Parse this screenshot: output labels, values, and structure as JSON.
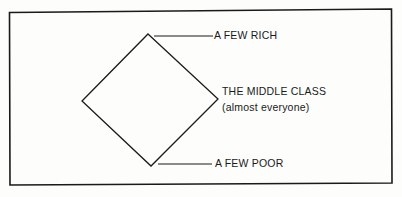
{
  "diagram": {
    "labels": {
      "top": "A FEW RICH",
      "middle_line1": "THE MIDDLE CLASS",
      "middle_line2": "(almost everyone)",
      "bottom": "A FEW POOR"
    },
    "colors": {
      "stroke": "#1a1a1a",
      "background": "#fdfdfb"
    }
  }
}
